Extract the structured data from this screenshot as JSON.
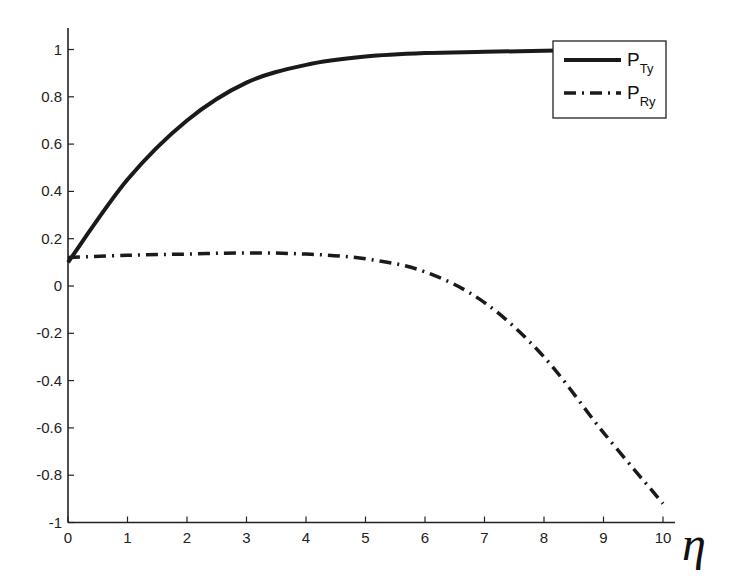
{
  "chart_data": {
    "type": "line",
    "title": "",
    "xlabel": "η",
    "ylabel": "",
    "xlim": [
      0,
      10
    ],
    "ylim": [
      -1,
      1.05
    ],
    "grid": false,
    "legend_position": "upper right",
    "x_ticks": [
      "0",
      "1",
      "2",
      "3",
      "4",
      "5",
      "6",
      "7",
      "8",
      "9",
      "10"
    ],
    "y_ticks": [
      "1",
      "0.8",
      "0.6",
      "0.4",
      "0.2",
      "0",
      "-0.2",
      "-0.4",
      "-0.6",
      "-0.8",
      "-1"
    ],
    "x": [
      0,
      1,
      2,
      3,
      4,
      5,
      6,
      7,
      8,
      9,
      10
    ],
    "series": [
      {
        "name": "P_Ty",
        "label_main": "P",
        "label_sub": "Ty",
        "style": "solid",
        "values": [
          0.1,
          0.45,
          0.7,
          0.86,
          0.935,
          0.97,
          0.985,
          0.99,
          0.995,
          1.0,
          1.0
        ]
      },
      {
        "name": "P_Ry",
        "label_main": "P",
        "label_sub": "Ry",
        "style": "dash-dot",
        "values": [
          0.12,
          0.13,
          0.135,
          0.14,
          0.135,
          0.115,
          0.06,
          -0.07,
          -0.3,
          -0.62,
          -0.92
        ]
      }
    ]
  }
}
